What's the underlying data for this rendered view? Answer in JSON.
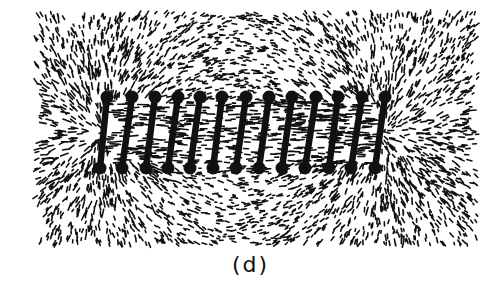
{
  "figure": {
    "caption": "(d)",
    "colors": {
      "ink": "#111111",
      "background": "#ffffff"
    },
    "field_region": {
      "x0": 35,
      "y0": 12,
      "x1": 478,
      "y1": 245
    },
    "solenoid": {
      "turns": 13,
      "top_points_x": [
        107,
        132,
        155,
        178,
        200,
        222,
        246,
        269,
        292,
        316,
        338,
        362,
        385
      ],
      "bottom_points_x": [
        100,
        122,
        146,
        168,
        190,
        213,
        236,
        259,
        282,
        305,
        329,
        351,
        375
      ],
      "top_y": 97,
      "bottom_y": 168
    }
  }
}
